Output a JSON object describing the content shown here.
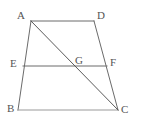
{
  "figure": {
    "type": "geometry-diagram",
    "shape": "trapezoid-with-midsegment-and-diagonal",
    "background_color": "#ffffff",
    "stroke_color": "#6b6b6b",
    "stroke_color_light": "#9a9a9a",
    "label_color": "#555555",
    "stroke_width": 1,
    "canvas": {
      "width": 144,
      "height": 126
    },
    "points": [
      {
        "id": "A",
        "label": "A",
        "x": 31,
        "y": 21,
        "label_x": 17,
        "label_y": 10
      },
      {
        "id": "D",
        "label": "D",
        "x": 94,
        "y": 21,
        "label_x": 97,
        "label_y": 10
      },
      {
        "id": "E",
        "label": "E",
        "x": 23,
        "y": 66,
        "label_x": 10,
        "label_y": 58
      },
      {
        "id": "G",
        "label": "G",
        "x": 73,
        "y": 66,
        "label_x": 75,
        "label_y": 55
      },
      {
        "id": "F",
        "label": "F",
        "x": 107,
        "y": 66,
        "label_x": 110,
        "label_y": 57
      },
      {
        "id": "B",
        "label": "B",
        "x": 18,
        "y": 110,
        "label_x": 7,
        "label_y": 103
      },
      {
        "id": "C",
        "label": "C",
        "x": 118,
        "y": 110,
        "label_x": 121,
        "label_y": 104
      }
    ],
    "segments": [
      {
        "id": "AD",
        "from": "A",
        "to": "D",
        "x1": 31,
        "y1": 21,
        "x2": 94,
        "y2": 21,
        "color": "#6b6b6b"
      },
      {
        "id": "AB",
        "from": "A",
        "to": "B",
        "x1": 31,
        "y1": 21,
        "x2": 18,
        "y2": 110,
        "color": "#6b6b6b"
      },
      {
        "id": "DC",
        "from": "D",
        "to": "C",
        "x1": 94,
        "y1": 21,
        "x2": 118,
        "y2": 110,
        "color": "#6b6b6b"
      },
      {
        "id": "BC",
        "from": "B",
        "to": "C",
        "x1": 18,
        "y1": 110,
        "x2": 118,
        "y2": 110,
        "color": "#9a9a9a"
      },
      {
        "id": "EF",
        "from": "E",
        "to": "F",
        "x1": 23,
        "y1": 66,
        "x2": 107,
        "y2": 66,
        "color": "#6b6b6b"
      },
      {
        "id": "AC",
        "from": "A",
        "to": "C",
        "x1": 31,
        "y1": 21,
        "x2": 118,
        "y2": 110,
        "color": "#5a5a5a"
      }
    ]
  }
}
